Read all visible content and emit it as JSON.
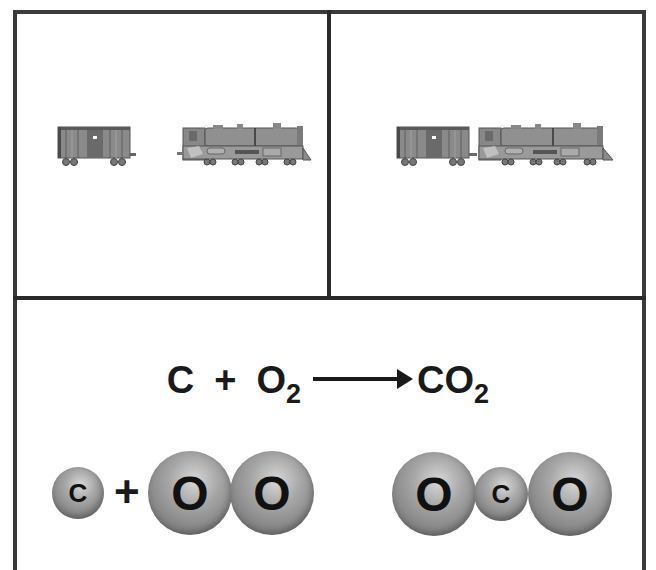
{
  "panels": {
    "top_left": {
      "description": "boxcar and locomotive separated",
      "items": [
        "boxcar",
        "locomotive"
      ]
    },
    "top_right": {
      "description": "boxcar coupled to locomotive",
      "items": [
        "boxcar",
        "locomotive"
      ]
    }
  },
  "equation": {
    "reactant1": "C",
    "plus": "+",
    "reactant2_base": "O",
    "reactant2_sub": "2",
    "product_base": "CO",
    "product_sub": "2"
  },
  "molecules": {
    "left": {
      "atom1": "C",
      "plus": "+",
      "atom2": "O",
      "atom3": "O"
    },
    "right": {
      "atom1": "O",
      "atom2": "C",
      "atom3": "O"
    }
  },
  "colors": {
    "border": "#3a3a3a",
    "text": "#1a1a1a",
    "atom_gray": "#8a8a8a",
    "train_gray": "#7a7a7a"
  }
}
